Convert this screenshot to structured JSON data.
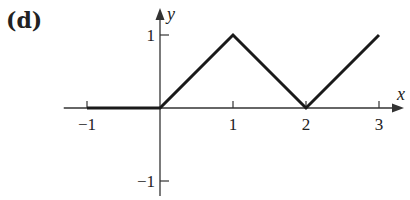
{
  "chart_data": {
    "type": "line",
    "panel_label": "(d)",
    "title": "",
    "xlabel": "x",
    "ylabel": "y",
    "xlim": [
      -1.25,
      3.35
    ],
    "ylim": [
      -1.25,
      1.4
    ],
    "grid": false,
    "legend": null,
    "x_ticks": [
      -1,
      1,
      2,
      3
    ],
    "x_tick_labels": [
      "−1",
      "1",
      "2",
      "3"
    ],
    "y_ticks": [
      1,
      -1
    ],
    "y_tick_labels": [
      "1",
      "−1"
    ],
    "series": [
      {
        "name": "piecewise linear",
        "x": [
          -1,
          0,
          1,
          2,
          3
        ],
        "y": [
          0,
          0,
          1,
          0,
          1
        ]
      }
    ]
  },
  "colors": {
    "line": "#1a1a1a",
    "axis": "#333333",
    "background": "#ffffff"
  }
}
